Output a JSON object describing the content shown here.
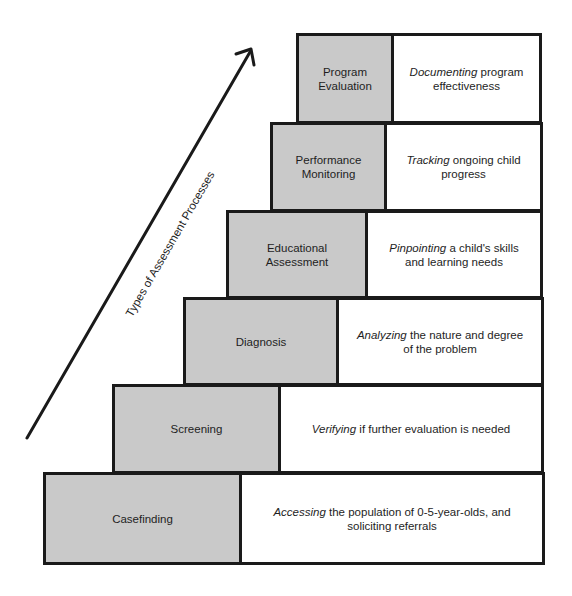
{
  "diagram": {
    "axis_label": "Types of Assessment Processes",
    "colors": {
      "name_fill": "#c9c9c9",
      "desc_fill": "#ffffff",
      "border": "#1a1a1a"
    },
    "steps": [
      {
        "name": "Program Evaluation",
        "verb": "Documenting",
        "rest": " program effectiveness"
      },
      {
        "name": "Performance Monitoring",
        "verb": "Tracking",
        "rest": " ongoing child progress"
      },
      {
        "name": "Educational Assessment",
        "verb": "Pinpointing",
        "rest": " a child's skills and learning needs"
      },
      {
        "name": "Diagnosis",
        "verb": "Analyzing",
        "rest": " the nature and degree of the problem"
      },
      {
        "name": "Screening",
        "verb": "Verifying",
        "rest": " if further evaluation is needed"
      },
      {
        "name": "Casefinding",
        "verb": "Accessing",
        "rest": " the population of 0-5-year-olds, and soliciting referrals"
      }
    ]
  }
}
